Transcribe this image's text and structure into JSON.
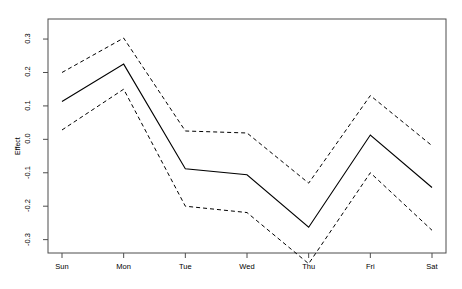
{
  "chart_data": {
    "type": "line",
    "title": "",
    "xlabel": "",
    "ylabel": "Effect",
    "categories": [
      "Sun",
      "Mon",
      "Tue",
      "Wed",
      "Thu",
      "Fri",
      "Sat"
    ],
    "ylim": [
      -0.34,
      0.36
    ],
    "yticks": [
      0.3,
      0.2,
      0.1,
      0.0,
      -0.1,
      -0.2,
      -0.3
    ],
    "ytick_labels": [
      "0.3",
      "0.2",
      "0.1",
      "0.0",
      "-0.1",
      "-0.2",
      "-0.3"
    ],
    "grid": false,
    "legend": null,
    "series": [
      {
        "name": "Effect",
        "style": "solid",
        "color": "#000000",
        "values": [
          0.113,
          0.225,
          -0.088,
          -0.106,
          -0.263,
          0.013,
          -0.144
        ]
      },
      {
        "name": "Upper confidence bound",
        "style": "dashed",
        "color": "#000000",
        "values": [
          0.2,
          0.303,
          0.025,
          0.019,
          -0.131,
          0.131,
          -0.019
        ]
      },
      {
        "name": "Lower confidence bound",
        "style": "dashed",
        "color": "#000000",
        "values": [
          0.028,
          0.15,
          -0.2,
          -0.219,
          -0.372,
          -0.1,
          -0.272
        ]
      }
    ],
    "axis_color": "#4d4d4d",
    "plot_box": {
      "left": 48,
      "right": 446,
      "top": 19,
      "bottom": 253
    }
  }
}
